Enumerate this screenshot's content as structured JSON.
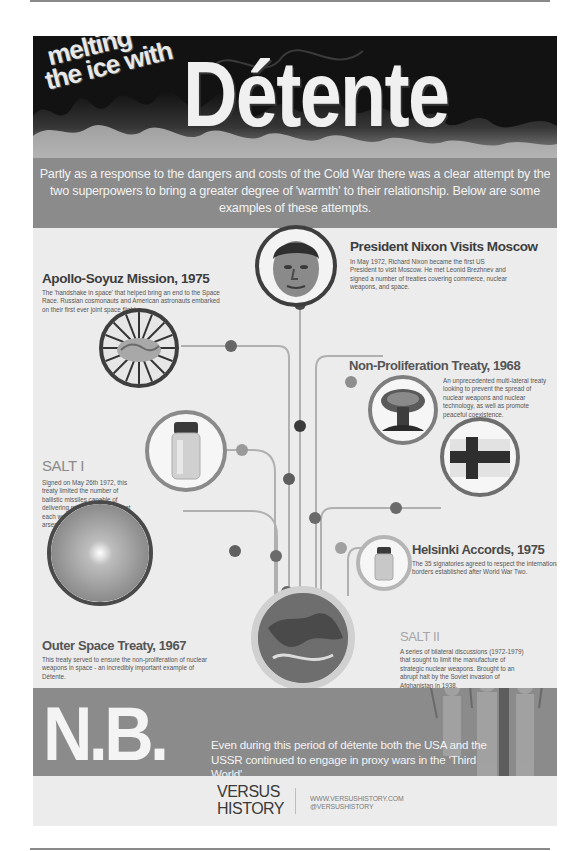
{
  "header": {
    "kicker_line1": "melting",
    "kicker_line2": "the ice with",
    "title": "Détente",
    "intro": "Partly as a response to the dangers and costs of the Cold War there was a clear attempt by the two superpowers to bring a greater degree of 'warmth' to their relationship. Below are some examples of these attempts."
  },
  "events": [
    {
      "id": "nixon",
      "title": "President Nixon Visits Moscow",
      "body": "In May 1972, Richard Nixon became the first US President to visit Moscow. He met Leonid Brezhnev and signed a number of treaties covering commerce, nuclear weapons, and space.",
      "image": "nixon-portrait"
    },
    {
      "id": "apollo-soyuz",
      "title": "Apollo-Soyuz Mission, 1975",
      "body": "The 'handshake in space' that helped bring an end to the Space Race. Russian cosmonauts and American astronauts embarked on their first ever joint space flight.",
      "image": "handshake-icon"
    },
    {
      "id": "npt",
      "title": "Non-Proliferation Treaty, 1968",
      "body": "An unprecedented multi-lateral treaty looking to prevent the spread of nuclear weapons and nuclear technology, as well as promote peaceful coexistence.",
      "image": "mushroom-cloud-icon"
    },
    {
      "id": "salt1",
      "title": "SALT I",
      "body": "Signed on May 26th 1972, this treaty limited the number of ballistic missiles capable of delivering nuclear payloads that each was allowed to have in their arsenal.",
      "image": "salt-shaker-icon"
    },
    {
      "id": "helsinki",
      "title": "Helsinki Accords, 1975",
      "body": "The 35 signatories agreed to respect the international borders established after World War Two.",
      "image": "finland-flag-icon"
    },
    {
      "id": "salt2",
      "title": "SALT II",
      "body": "A series of bilateral discussions (1972-1979) that sought to limit the manufacture of strategic nuclear weapons. Brought to an abrupt halt by the Soviet invasion of Afghanistan in 1938.",
      "image": "salt-shaker-icon"
    },
    {
      "id": "outer-space",
      "title": "Outer Space Treaty, 1967",
      "body": "This treaty served to ensure the non-proliferation of nuclear weapons in space - an incredibly important example of Détente.",
      "image": "galaxy-icon"
    }
  ],
  "nb": {
    "letters": "N.B.",
    "text": "Even during this period of détente both the USA and the USSR continued to engage in proxy wars in the 'Third World'."
  },
  "footer": {
    "brand_line1": "VERSUS",
    "brand_line2": "HISTORY",
    "website": "WWW.VERSUSHISTORY.COM",
    "handle": "@VERSUSHISTORY"
  },
  "colors": {
    "band_gray": "#8b8b8b",
    "dark_ring": "#3e3e3e",
    "mid_ring": "#7e7e7e",
    "light_ring": "#a9a9a9",
    "line": "#b0b0b0"
  }
}
